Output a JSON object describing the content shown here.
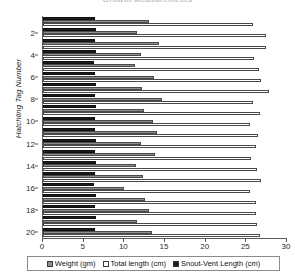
{
  "chart": {
    "title": "Growth Measurements",
    "title_visible": false
  },
  "legend": {
    "position": "bottom",
    "items": [
      {
        "key": "weight",
        "label": "Weight  (gm)",
        "color": "#8d8d8d",
        "swatch": "weight-swatch"
      },
      {
        "key": "total",
        "label": "Total  length  (cm)",
        "color": "#ffffff",
        "swatch": "total-length-swatch"
      },
      {
        "key": "snout",
        "label": "Snout-Vent  Length  (cm)",
        "color": "#1c1c1c",
        "swatch": "snout-vent-swatch"
      }
    ]
  },
  "axes": {
    "x": {
      "label": "",
      "ticks": [
        "0",
        "5",
        "10",
        "15",
        "20",
        "25",
        "30"
      ],
      "min": 0,
      "max": 30
    },
    "y": {
      "label": "Hatchling Tag Number",
      "ticks": [
        "2",
        "4",
        "6",
        "8",
        "10",
        "12",
        "14",
        "16",
        "18",
        "20"
      ],
      "min": 1,
      "max": 20
    }
  },
  "chart_data": {
    "type": "bar",
    "orientation": "horizontal",
    "title": "",
    "xlabel": "",
    "ylabel": "Hatchling Tag Number",
    "xlim": [
      0,
      30
    ],
    "grid": false,
    "legend_position": "bottom",
    "categories": [
      1,
      2,
      3,
      4,
      5,
      6,
      7,
      8,
      9,
      10,
      11,
      12,
      13,
      14,
      15,
      16,
      17,
      18,
      19,
      20
    ],
    "category_label": "Hatchling Tag Number",
    "series": [
      {
        "name": "Weight  (gm)",
        "unit": "gm",
        "color": "#8d8d8d",
        "values": [
          13.0,
          11.5,
          14.3,
          12.0,
          11.3,
          13.6,
          12.2,
          14.6,
          12.4,
          13.5,
          14.0,
          12.1,
          13.8,
          11.4,
          12.3,
          10.0,
          12.5,
          13.0,
          11.6,
          13.4
        ]
      },
      {
        "name": "Total  length  (cm)",
        "unit": "cm",
        "color": "#ffffff",
        "values": [
          25.8,
          27.4,
          27.4,
          25.9,
          26.6,
          26.8,
          27.8,
          25.8,
          26.7,
          25.5,
          26.4,
          26.2,
          25.6,
          26.3,
          26.8,
          25.4,
          26.2,
          26.2,
          26.3,
          26.7
        ]
      },
      {
        "name": "Snout-Vent  Length  (cm)",
        "unit": "cm",
        "color": "#1c1c1c",
        "values": [
          6.4,
          6.5,
          6.4,
          6.5,
          6.3,
          6.4,
          6.5,
          6.4,
          6.5,
          6.4,
          6.4,
          6.5,
          6.4,
          6.5,
          6.4,
          6.3,
          6.5,
          6.4,
          6.5,
          6.4
        ]
      }
    ]
  }
}
